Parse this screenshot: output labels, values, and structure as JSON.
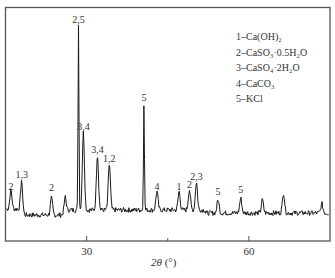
{
  "chart_data": {
    "type": "line",
    "title": "",
    "xlabel": "2θ (°)",
    "ylabel": "",
    "xlim": [
      15,
      75
    ],
    "x_ticks": [
      30,
      60
    ],
    "x_minor_ticks": [
      45
    ],
    "grid": false,
    "legend_position": "upper right",
    "legend": [
      {
        "id": "1",
        "phase": "Ca(OH)2",
        "text": "1–Ca(OH)₂"
      },
      {
        "id": "2",
        "phase": "CaSO3·0.5H2O",
        "text": "2–CaSO₃·0.5H₂O"
      },
      {
        "id": "3",
        "phase": "CaSO4·2H2O",
        "text": "3–CaSO₄·2H₂O"
      },
      {
        "id": "4",
        "phase": "CaCO3",
        "text": "4–CaCO₃"
      },
      {
        "id": "5",
        "phase": "KCl",
        "text": "5–KCl"
      }
    ],
    "peaks": [
      {
        "two_theta": 16.0,
        "rel_intensity": 0.1,
        "label": "2"
      },
      {
        "two_theta": 18.0,
        "rel_intensity": 0.16,
        "label": "1,3"
      },
      {
        "two_theta": 23.5,
        "rel_intensity": 0.09,
        "label": "2"
      },
      {
        "two_theta": 26.0,
        "rel_intensity": 0.08,
        "label": ""
      },
      {
        "two_theta": 28.5,
        "rel_intensity": 1.0,
        "label": "2,5"
      },
      {
        "two_theta": 29.4,
        "rel_intensity": 0.42,
        "label": "3,4"
      },
      {
        "two_theta": 32.0,
        "rel_intensity": 0.3,
        "label": "3,4"
      },
      {
        "two_theta": 34.2,
        "rel_intensity": 0.25,
        "label": "1,2"
      },
      {
        "two_theta": 40.6,
        "rel_intensity": 0.58,
        "label": "5"
      },
      {
        "two_theta": 43.0,
        "rel_intensity": 0.1,
        "label": "4"
      },
      {
        "two_theta": 47.1,
        "rel_intensity": 0.1,
        "label": "1"
      },
      {
        "two_theta": 49.0,
        "rel_intensity": 0.11,
        "label": "2"
      },
      {
        "two_theta": 50.3,
        "rel_intensity": 0.15,
        "label": "2,3"
      },
      {
        "two_theta": 54.3,
        "rel_intensity": 0.07,
        "label": "5"
      },
      {
        "two_theta": 58.5,
        "rel_intensity": 0.08,
        "label": "5"
      },
      {
        "two_theta": 62.5,
        "rel_intensity": 0.07,
        "label": ""
      },
      {
        "two_theta": 66.4,
        "rel_intensity": 0.11,
        "label": ""
      },
      {
        "two_theta": 73.5,
        "rel_intensity": 0.05,
        "label": ""
      }
    ]
  },
  "ui": {
    "x_axis_label_symbol": "2θ",
    "x_axis_label_unit": " (°)",
    "tick_30": "30",
    "tick_60": "60"
  }
}
